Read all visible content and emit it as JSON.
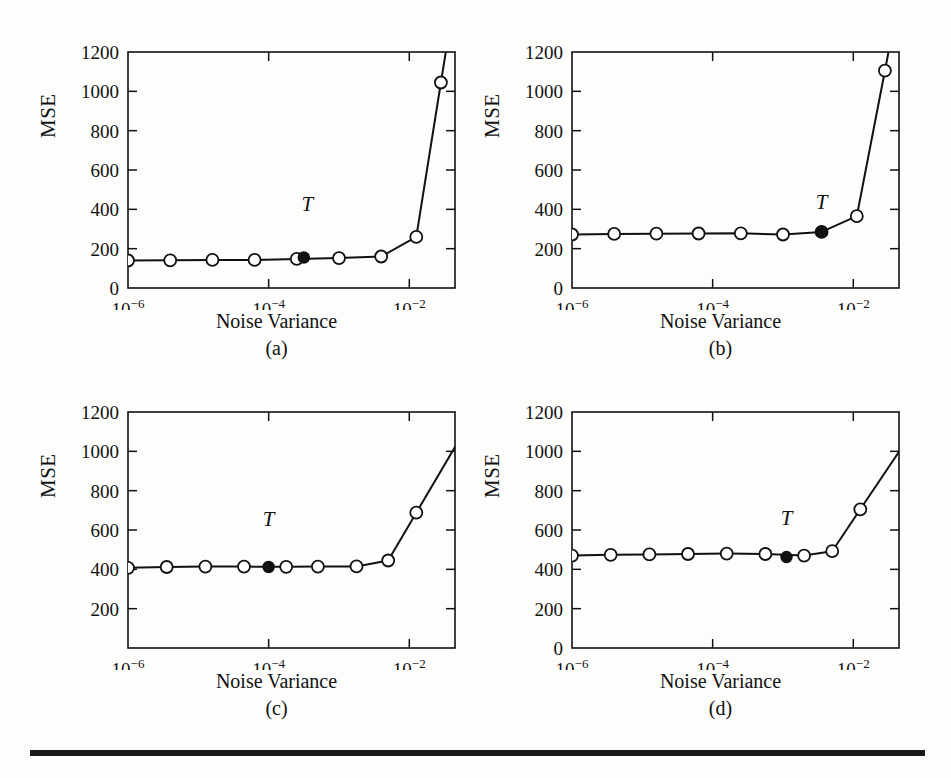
{
  "figure": {
    "background": "#fdfdfb",
    "ink_color": "#111111",
    "rule": {
      "present": true
    }
  },
  "axis_common": {
    "ylabel": "MSE",
    "xlabel": "Noise Variance",
    "ylim": [
      0,
      1200
    ],
    "xlim_log10": [
      -6,
      -1.35
    ],
    "y_ticks": [
      0,
      200,
      400,
      600,
      800,
      1000,
      1200
    ],
    "x_ticks_log10": [
      -6,
      -4,
      -2
    ],
    "x_tick_labels": [
      "10",
      "10",
      "10"
    ],
    "x_tick_exponents": [
      "−6",
      "−4",
      "−2"
    ],
    "t_label": "T",
    "grid": false,
    "legend": false,
    "box_frame": true
  },
  "chart_data": [
    {
      "type": "line",
      "panel": "a",
      "caption": "(a)",
      "title": "",
      "xlabel": "Noise Variance",
      "ylabel": "MSE",
      "xscale": "log",
      "ylim": [
        0,
        1200
      ],
      "xlim": [
        1e-06,
        0.045
      ],
      "y_ticks": [
        0,
        200,
        400,
        600,
        800,
        1000,
        1200
      ],
      "x_ticks": [
        1e-06,
        0.0001,
        0.01
      ],
      "x_tick_labels": [
        "10^-6",
        "10^-4",
        "10^-2"
      ],
      "marker": "open-circle",
      "x": [
        1e-06,
        5.6e-06,
        3.2e-05,
        0.00018,
        0.001,
        0.0056,
        0.032,
        0.18
      ],
      "x_log10": [
        -6.0,
        -5.25,
        -4.5,
        -3.75,
        -3.0,
        -2.25,
        -1.5,
        -0.75
      ],
      "series": [
        {
          "name": "MSE",
          "x_log10": [
            -6.0,
            -5.4,
            -4.8,
            -4.2,
            -3.6,
            -3.0,
            -2.4,
            -1.9,
            -1.55
          ],
          "values": [
            140,
            141,
            143,
            143,
            148,
            152,
            160,
            260,
            1045
          ]
        }
      ],
      "annotation": {
        "label": "T",
        "x_log10": -3.5,
        "value": 155,
        "label_x_log10": -3.45,
        "label_value": 390,
        "marker": "filled-circle"
      }
    },
    {
      "type": "line",
      "panel": "b",
      "caption": "(b)",
      "title": "",
      "xlabel": "Noise Variance",
      "ylabel": "MSE",
      "xscale": "log",
      "ylim": [
        0,
        1200
      ],
      "xlim": [
        1e-06,
        0.045
      ],
      "y_ticks": [
        0,
        200,
        400,
        600,
        800,
        1000,
        1200
      ],
      "x_ticks": [
        1e-06,
        0.0001,
        0.01
      ],
      "x_tick_labels": [
        "10^-6",
        "10^-4",
        "10^-2"
      ],
      "marker": "open-circle",
      "series": [
        {
          "name": "MSE",
          "x_log10": [
            -6.0,
            -5.4,
            -4.8,
            -4.2,
            -3.6,
            -3.0,
            -2.45,
            -1.95,
            -1.55
          ],
          "values": [
            272,
            275,
            276,
            277,
            278,
            272,
            285,
            365,
            1105
          ]
        }
      ],
      "annotation": {
        "label": "T",
        "x_log10": -2.45,
        "value": 285,
        "label_x_log10": -2.45,
        "label_value": 400,
        "marker": "filled-circle"
      }
    },
    {
      "type": "line",
      "panel": "c",
      "caption": "(c)",
      "title": "",
      "xlabel": "Noise Variance",
      "ylabel": "MSE",
      "xscale": "log",
      "ylim": [
        0,
        1200
      ],
      "xlim": [
        1e-06,
        0.045
      ],
      "y_ticks": [
        200,
        400,
        600,
        800,
        1000,
        1200
      ],
      "y_tick_zero_hidden": true,
      "x_ticks": [
        1e-06,
        0.0001,
        0.01
      ],
      "x_tick_labels": [
        "10^-6",
        "10^-4",
        "10^-2"
      ],
      "marker": "open-circle",
      "series": [
        {
          "name": "MSE",
          "x_log10": [
            -6.0,
            -5.45,
            -4.9,
            -4.35,
            -3.75,
            -3.3,
            -2.75,
            -2.3,
            -1.9
          ],
          "values": [
            408,
            412,
            414,
            414,
            413,
            414,
            415,
            445,
            688
          ]
        }
      ],
      "annotation": {
        "label": "T",
        "x_log10": -4.0,
        "value": 412,
        "label_x_log10": -4.0,
        "label_value": 620,
        "marker": "filled-circle"
      }
    },
    {
      "type": "line",
      "panel": "d",
      "caption": "(d)",
      "title": "",
      "xlabel": "Noise Variance",
      "ylabel": "MSE",
      "xscale": "log",
      "ylim": [
        0,
        1200
      ],
      "xlim": [
        1e-06,
        0.045
      ],
      "y_ticks": [
        0,
        200,
        400,
        600,
        800,
        1000,
        1200
      ],
      "x_ticks": [
        1e-06,
        0.0001,
        0.01
      ],
      "x_tick_labels": [
        "10^-6",
        "10^-4",
        "10^-2"
      ],
      "marker": "open-circle",
      "series": [
        {
          "name": "MSE",
          "x_log10": [
            -6.0,
            -5.45,
            -4.9,
            -4.35,
            -3.8,
            -3.25,
            -2.7,
            -2.3,
            -1.9
          ],
          "values": [
            470,
            474,
            476,
            478,
            480,
            478,
            470,
            492,
            705
          ]
        }
      ],
      "annotation": {
        "label": "T",
        "x_log10": -2.95,
        "value": 462,
        "label_x_log10": -2.95,
        "label_value": 625,
        "marker": "filled-circle"
      }
    }
  ]
}
